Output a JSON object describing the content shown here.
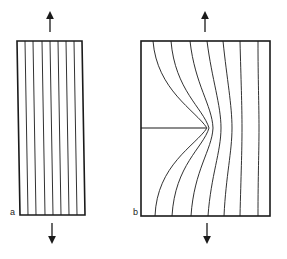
{
  "figure": {
    "panels": [
      {
        "id": "a",
        "label": "a",
        "description": "Uncracked plate under tension with uniform straight field lines"
      },
      {
        "id": "b",
        "label": "b",
        "description": "Plate with edge crack under tension; field lines concentrate around crack tip"
      }
    ],
    "arrows": {
      "top": "tension up",
      "bottom": "tension down"
    },
    "colors": {
      "line": "#1a1a1a",
      "background": "#ffffff"
    }
  }
}
